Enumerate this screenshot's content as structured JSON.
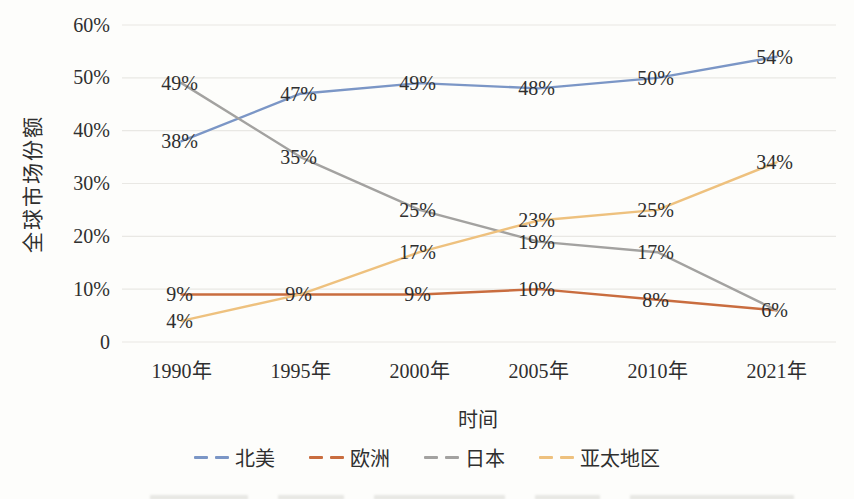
{
  "chart_data": {
    "type": "line",
    "title": "",
    "xlabel": "时间",
    "ylabel": "全球市场份额",
    "categories": [
      "1990年",
      "1995年",
      "2000年",
      "2005年",
      "2010年",
      "2021年"
    ],
    "series": [
      {
        "name": "北美",
        "color": "#7b96c6",
        "values": [
          38,
          47,
          49,
          48,
          50,
          54
        ],
        "hidden_labels": []
      },
      {
        "name": "欧洲",
        "color": "#c96d3f",
        "values": [
          9,
          9,
          9,
          10,
          8,
          6
        ],
        "hidden_labels": []
      },
      {
        "name": "日本",
        "color": "#a3a2a0",
        "values": [
          49,
          35,
          25,
          19,
          17,
          6
        ],
        "hidden_labels": [
          5
        ]
      },
      {
        "name": "亚太地区",
        "color": "#eec17e",
        "values": [
          4,
          9,
          17,
          23,
          25,
          34
        ],
        "hidden_labels": [
          1
        ]
      }
    ],
    "ylim": [
      0,
      60
    ],
    "yticks": [
      "0",
      "10%",
      "20%",
      "30%",
      "40%",
      "50%",
      "60%"
    ],
    "ytick_step": 10,
    "grid": true,
    "legend_position": "bottom",
    "data_label_suffix": "%",
    "grid_color": "#e9e8e4",
    "text_color": "#2f2f2f",
    "background": "#fdfdfb",
    "line_style": "solid",
    "legend_marker_style": "dashed"
  }
}
